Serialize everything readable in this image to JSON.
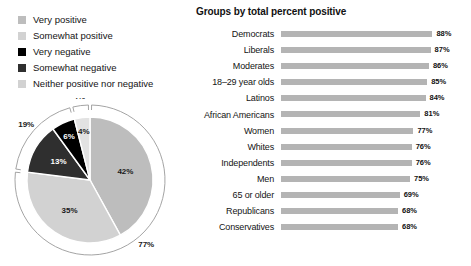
{
  "legend": {
    "items": [
      {
        "label": "Very positive",
        "color": "#c6c6c6",
        "swatch_name": "legend-swatch-very-positive"
      },
      {
        "label": "Somewhat positive",
        "color": "#dcdcdc",
        "swatch_name": "legend-swatch-somewhat-positive"
      },
      {
        "label": "Very negative",
        "color": "#000000",
        "swatch_name": "legend-swatch-very-negative"
      },
      {
        "label": "Somewhat negative",
        "color": "#2f2f2f",
        "swatch_name": "legend-swatch-somewhat-negative"
      },
      {
        "label": "Neither positive nor negative",
        "color": "#d2d2d2",
        "swatch_name": "legend-swatch-neither"
      }
    ]
  },
  "chart_data": [
    {
      "type": "pie",
      "title": "",
      "categories": [
        "Very positive",
        "Somewhat positive",
        "Somewhat negative",
        "Very negative",
        "Neither positive nor negative"
      ],
      "values": [
        42,
        35,
        13,
        6,
        4
      ],
      "labels": [
        "42%",
        "35%",
        "13%",
        "6%",
        "4%"
      ],
      "colors": [
        "#bdbdbd",
        "#d2d2d2",
        "#2f2f2f",
        "#000000",
        "#e2e2e2"
      ],
      "label_fill": [
        "dark",
        "dark",
        "light",
        "light",
        "dark"
      ],
      "annotations": [
        {
          "label": "77%",
          "covers": [
            "Very positive",
            "Somewhat positive"
          ],
          "position": "outer-arc-bottom-right"
        },
        {
          "label": "19%",
          "covers": [
            "Somewhat negative",
            "Very negative"
          ],
          "position": "outer-arc-upper-left"
        },
        {
          "label": "4%",
          "covers": [
            "Neither positive nor negative"
          ],
          "position": "outer-arc-top"
        }
      ],
      "legend": "external-left-top",
      "grid": false
    },
    {
      "type": "bar",
      "orientation": "horizontal",
      "title": "Groups by total percent positive",
      "xlabel": "",
      "ylabel": "",
      "xlim": [
        0,
        100
      ],
      "grid": false,
      "bar_color": "#b4b4b4",
      "categories": [
        "Democrats",
        "Liberals",
        "Moderates",
        "18–29 year olds",
        "Latinos",
        "African Americans",
        "Women",
        "Whites",
        "Independents",
        "Men",
        "65 or older",
        "Republicans",
        "Conservatives"
      ],
      "values": [
        88,
        87,
        86,
        85,
        84,
        81,
        77,
        76,
        76,
        75,
        69,
        68,
        68
      ],
      "value_labels": [
        "88%",
        "87%",
        "86%",
        "85%",
        "84%",
        "81%",
        "77%",
        "76%",
        "76%",
        "75%",
        "69%",
        "68%",
        "68%"
      ]
    }
  ]
}
